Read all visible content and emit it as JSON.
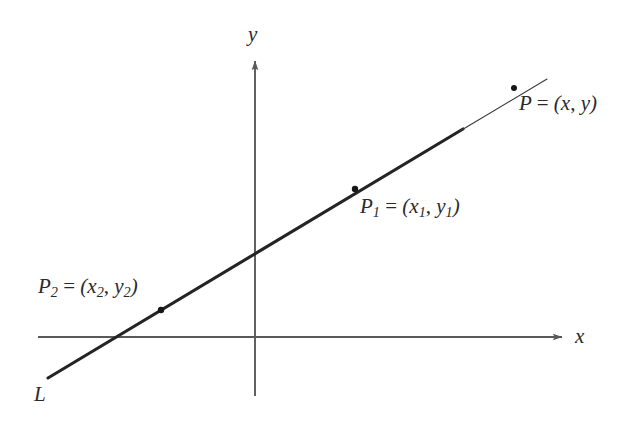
{
  "figure": {
    "background_color": "#ffffff",
    "width": 638,
    "height": 428
  },
  "axes": {
    "x_label": "x",
    "y_label": "y",
    "axis_color": "#595959",
    "origin": {
      "x": 255,
      "y": 337
    },
    "x_axis": {
      "start_x": 38,
      "end_x": 566,
      "y": 337,
      "arrow": "right"
    },
    "y_axis": {
      "x": 255,
      "start_y": 396,
      "end_y": 57,
      "arrow": "up"
    }
  },
  "line": {
    "name": "L",
    "label": "L",
    "color": "#242424",
    "thick_from": {
      "x": 48,
      "y": 378
    },
    "thick_to": {
      "x": 462,
      "y": 130
    },
    "thin_to": {
      "x": 547,
      "y": 79
    },
    "thick_width": 3.1,
    "thin_width": 1.1
  },
  "points": [
    {
      "id": "P",
      "label_html": "<i>P</i> <span class=\"rom\">=</span> (<i>x</i><span class=\"rom\">,</span> <i>y</i>)",
      "label_text": "P = (x, y)",
      "dot": {
        "x": 514,
        "y": 88
      }
    },
    {
      "id": "P1",
      "label_html": "<i>P</i><sub>1</sub> <span class=\"rom\">=</span> (<i>x</i><sub>1</sub><span class=\"rom\">,</span> <i>y</i><sub>1</sub>)",
      "label_text": "P1 = (x1, y1)",
      "dot": {
        "x": 355,
        "y": 189
      }
    },
    {
      "id": "P2",
      "label_html": "<i>P</i><sub>2</sub> <span class=\"rom\">=</span> (<i>x</i><sub>2</sub><span class=\"rom\">,</span> <i>y</i><sub>2</sub>)",
      "label_text": "P2 = (x2, y2)",
      "dot": {
        "x": 161,
        "y": 310
      }
    }
  ],
  "chart_data": {
    "type": "line",
    "title": "",
    "xlabel": "x",
    "ylabel": "y",
    "grid": false,
    "legend": null,
    "annotations": [
      "P = (x, y)",
      "P1 = (x1, y1)",
      "P2 = (x2, y2)",
      "L"
    ],
    "series": [
      {
        "name": "L",
        "description": "Straight line of positive slope passing through P2, P1 and P, drawn bold from the lower-left end up to just past P1 and thin beyond",
        "pixel_endpoints": [
          [
            48,
            378
          ],
          [
            547,
            79
          ]
        ],
        "marked_points": [
          {
            "name": "P2",
            "pixel": [
              161,
              310
            ]
          },
          {
            "name": "P1",
            "pixel": [
              355,
              189
            ]
          },
          {
            "name": "P",
            "pixel": [
              514,
              88
            ]
          }
        ],
        "x_intercept_pixel": [
          105,
          337
        ],
        "y_intercept_pixel": [
          255,
          250
        ]
      }
    ]
  }
}
